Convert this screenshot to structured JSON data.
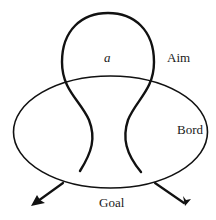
{
  "diagram": {
    "type": "aim-goal loop diagram",
    "labels": {
      "inner": "a",
      "aim": "Aim",
      "bord": "Bord",
      "goal": "Goal"
    },
    "colors": {
      "stroke": "#111111",
      "background": "#ffffff",
      "text": "#1a1a1a"
    }
  }
}
